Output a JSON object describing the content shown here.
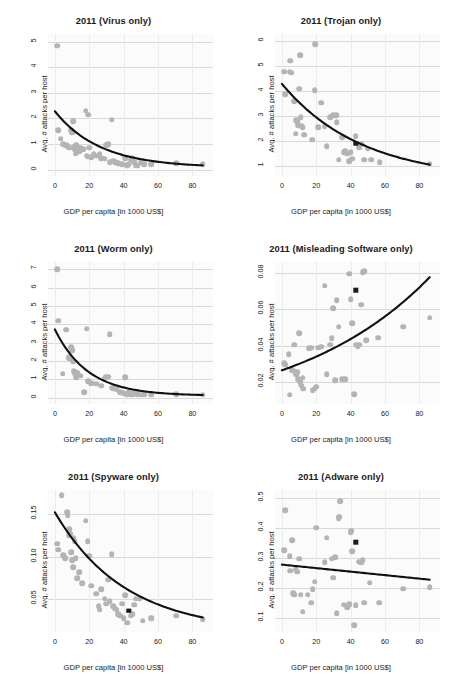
{
  "figure": {
    "xlabel": "GDP per capita [in 1000 US$]",
    "ylabel": "Avg. # attacks per host",
    "colors": {
      "point": "#b4b4b4",
      "fit": "#111111",
      "marker": "#1b1b1b",
      "grid": "#d8d8d8",
      "panel_bg": "#fbfbfb"
    }
  },
  "chart_data": [
    {
      "type": "scatter",
      "title": "2011 (Virus only)",
      "xlabel": "GDP per capita [in 1000 US$]",
      "ylabel": "Avg. # attacks per host",
      "xlim": [
        -4,
        92
      ],
      "ylim": [
        -0.25,
        5.3
      ],
      "xticks": [
        0,
        20,
        40,
        60,
        80
      ],
      "yticks": [
        0,
        1,
        2,
        3,
        4,
        5
      ],
      "grid": true,
      "legend": "none",
      "points": [
        [
          1.5,
          4.85
        ],
        [
          2.0,
          1.55
        ],
        [
          3.5,
          1.2
        ],
        [
          5.0,
          1.0
        ],
        [
          6.5,
          0.95
        ],
        [
          7.5,
          0.92
        ],
        [
          8.5,
          0.85
        ],
        [
          9.5,
          1.55
        ],
        [
          10.0,
          1.45
        ],
        [
          10.5,
          1.9
        ],
        [
          11.0,
          0.88
        ],
        [
          11.5,
          0.8
        ],
        [
          12.0,
          0.62
        ],
        [
          12.5,
          0.95
        ],
        [
          13.0,
          0.9
        ],
        [
          14.0,
          0.72
        ],
        [
          15.0,
          0.85
        ],
        [
          16.5,
          0.8
        ],
        [
          18.0,
          2.3
        ],
        [
          18.5,
          0.55
        ],
        [
          19.0,
          0.5
        ],
        [
          19.5,
          2.15
        ],
        [
          20.0,
          0.85
        ],
        [
          21.0,
          0.48
        ],
        [
          22.5,
          0.6
        ],
        [
          24.0,
          0.55
        ],
        [
          26.0,
          0.62
        ],
        [
          27.0,
          0.45
        ],
        [
          29.0,
          0.42
        ],
        [
          30.0,
          0.95
        ],
        [
          31.0,
          1.0
        ],
        [
          32.0,
          0.3
        ],
        [
          33.0,
          1.95
        ],
        [
          34.0,
          0.35
        ],
        [
          35.0,
          0.3
        ],
        [
          37.0,
          0.25
        ],
        [
          39.0,
          0.2
        ],
        [
          41.0,
          0.45
        ],
        [
          42.0,
          0.18
        ],
        [
          43.0,
          0.22
        ],
        [
          44.0,
          0.4
        ],
        [
          45.0,
          0.45
        ],
        [
          46.0,
          0.28
        ],
        [
          47.0,
          0.18
        ],
        [
          48.0,
          0.15
        ],
        [
          50.0,
          0.3
        ],
        [
          52.0,
          0.2
        ],
        [
          56.0,
          0.2
        ],
        [
          70.5,
          0.25
        ],
        [
          86.0,
          0.22
        ]
      ],
      "fit": {
        "kind": "decay",
        "y0": 2.28,
        "yinf": 0.08,
        "rate": 0.038
      },
      "highlight": null
    },
    {
      "type": "scatter",
      "title": "2011 (Trojan only)",
      "xlabel": "GDP per capita [in 1000 US$]",
      "ylabel": "Avg. # attacks per host",
      "xlim": [
        -4,
        92
      ],
      "ylim": [
        0.6,
        6.3
      ],
      "xticks": [
        0,
        20,
        40,
        60,
        80
      ],
      "yticks": [
        1,
        2,
        3,
        4,
        5,
        6
      ],
      "grid": true,
      "legend": "none",
      "points": [
        [
          1.5,
          4.78
        ],
        [
          2.0,
          3.88
        ],
        [
          4.5,
          4.78
        ],
        [
          5.0,
          5.22
        ],
        [
          5.5,
          4.75
        ],
        [
          7.0,
          3.6
        ],
        [
          8.0,
          2.3
        ],
        [
          8.5,
          2.85
        ],
        [
          9.0,
          2.8
        ],
        [
          9.5,
          2.65
        ],
        [
          10.0,
          4.1
        ],
        [
          10.5,
          5.45
        ],
        [
          11.0,
          2.95
        ],
        [
          11.5,
          2.6
        ],
        [
          12.0,
          2.55
        ],
        [
          13.0,
          2.25
        ],
        [
          17.5,
          2.05
        ],
        [
          19.0,
          4.05
        ],
        [
          19.5,
          5.88
        ],
        [
          21.0,
          2.55
        ],
        [
          23.0,
          3.55
        ],
        [
          25.0,
          2.6
        ],
        [
          26.0,
          1.8
        ],
        [
          28.0,
          2.95
        ],
        [
          30.0,
          3.05
        ],
        [
          31.5,
          3.05
        ],
        [
          32.0,
          2.75
        ],
        [
          33.0,
          1.25
        ],
        [
          35.0,
          2.15
        ],
        [
          36.0,
          1.55
        ],
        [
          37.0,
          1.6
        ],
        [
          38.0,
          1.5
        ],
        [
          39.0,
          1.2
        ],
        [
          40.0,
          1.55
        ],
        [
          41.0,
          1.3
        ],
        [
          43.0,
          2.2
        ],
        [
          45.0,
          1.75
        ],
        [
          46.0,
          1.9
        ],
        [
          48.0,
          1.25
        ],
        [
          50.0,
          1.7
        ],
        [
          52.0,
          1.25
        ],
        [
          57.0,
          1.15
        ],
        [
          86.0,
          1.1
        ]
      ],
      "fit": {
        "kind": "decay",
        "y0": 4.3,
        "yinf": 0.45,
        "rate": 0.0215
      },
      "highlight": [
        43.0,
        1.9
      ]
    },
    {
      "type": "scatter",
      "title": "2011 (Worm only)",
      "xlabel": "GDP per capita [in 1000 US$]",
      "ylabel": "Avg. # attacks per host",
      "xlim": [
        -4,
        92
      ],
      "ylim": [
        -0.35,
        7.4
      ],
      "xticks": [
        0,
        20,
        40,
        60,
        80
      ],
      "yticks": [
        0,
        1,
        2,
        3,
        4,
        5,
        6,
        7
      ],
      "grid": true,
      "legend": "none",
      "points": [
        [
          1.5,
          7.0
        ],
        [
          2.0,
          4.2
        ],
        [
          4.5,
          1.3
        ],
        [
          6.5,
          3.7
        ],
        [
          8.0,
          2.2
        ],
        [
          8.5,
          2.15
        ],
        [
          9.5,
          2.75
        ],
        [
          10.0,
          2.6
        ],
        [
          10.5,
          2.0
        ],
        [
          11.0,
          1.45
        ],
        [
          11.5,
          1.3
        ],
        [
          12.0,
          1.4
        ],
        [
          12.5,
          1.1
        ],
        [
          13.0,
          1.35
        ],
        [
          15.0,
          1.2
        ],
        [
          17.0,
          0.3
        ],
        [
          18.5,
          3.75
        ],
        [
          19.5,
          0.9
        ],
        [
          21.0,
          0.8
        ],
        [
          24.0,
          0.75
        ],
        [
          27.0,
          0.65
        ],
        [
          29.0,
          1.05
        ],
        [
          30.0,
          1.15
        ],
        [
          31.0,
          1.15
        ],
        [
          32.0,
          3.45
        ],
        [
          33.0,
          0.55
        ],
        [
          34.0,
          0.5
        ],
        [
          36.0,
          0.45
        ],
        [
          38.0,
          0.3
        ],
        [
          40.0,
          0.25
        ],
        [
          41.0,
          1.1
        ],
        [
          42.0,
          0.2
        ],
        [
          43.0,
          0.3
        ],
        [
          44.0,
          0.15
        ],
        [
          45.0,
          0.2
        ],
        [
          46.0,
          0.25
        ],
        [
          48.0,
          0.2
        ],
        [
          50.0,
          0.15
        ],
        [
          52.0,
          0.2
        ],
        [
          56.0,
          0.15
        ],
        [
          70.5,
          0.2
        ],
        [
          86.0,
          0.15
        ]
      ],
      "fit": {
        "kind": "decay",
        "y0": 3.72,
        "yinf": 0.1,
        "rate": 0.052
      },
      "highlight": null
    },
    {
      "type": "scatter",
      "title": "2011 (Misleading Software only)",
      "xlabel": "GDP per capita [in 1000 US$]",
      "ylabel": "Avg. # attacks per host",
      "xlim": [
        -4,
        92
      ],
      "ylim": [
        0.008,
        0.086
      ],
      "xticks": [
        0,
        20,
        40,
        60,
        80
      ],
      "yticks": [
        0.02,
        0.04,
        0.06,
        0.08
      ],
      "ytick_labels": [
        "0.02",
        "0.04",
        "0.06",
        "0.08"
      ],
      "grid": true,
      "legend": "none",
      "points": [
        [
          1.5,
          0.0305
        ],
        [
          2.0,
          0.0295
        ],
        [
          4.0,
          0.0355
        ],
        [
          4.5,
          0.013
        ],
        [
          6.0,
          0.0265
        ],
        [
          7.0,
          0.0405
        ],
        [
          8.0,
          0.0255
        ],
        [
          8.5,
          0.0245
        ],
        [
          9.0,
          0.0255
        ],
        [
          9.5,
          0.0215
        ],
        [
          10.0,
          0.047
        ],
        [
          10.5,
          0.0205
        ],
        [
          11.0,
          0.0185
        ],
        [
          11.5,
          0.018
        ],
        [
          12.0,
          0.0225
        ],
        [
          12.5,
          0.0165
        ],
        [
          16.0,
          0.0385
        ],
        [
          17.0,
          0.039
        ],
        [
          18.0,
          0.0155
        ],
        [
          19.0,
          0.0165
        ],
        [
          20.0,
          0.0175
        ],
        [
          21.0,
          0.039
        ],
        [
          23.0,
          0.0395
        ],
        [
          25.0,
          0.073
        ],
        [
          26.0,
          0.0245
        ],
        [
          28.0,
          0.0405
        ],
        [
          29.0,
          0.044
        ],
        [
          30.0,
          0.0605
        ],
        [
          31.0,
          0.021
        ],
        [
          32.0,
          0.065
        ],
        [
          33.0,
          0.0505
        ],
        [
          35.0,
          0.0215
        ],
        [
          37.0,
          0.0215
        ],
        [
          39.0,
          0.0795
        ],
        [
          40.0,
          0.0655
        ],
        [
          41.0,
          0.0525
        ],
        [
          42.0,
          0.0135
        ],
        [
          43.0,
          0.0405
        ],
        [
          44.0,
          0.0395
        ],
        [
          45.0,
          0.0405
        ],
        [
          46.0,
          0.0625
        ],
        [
          47.0,
          0.0805
        ],
        [
          48.0,
          0.081
        ],
        [
          49.0,
          0.043
        ],
        [
          56.0,
          0.0445
        ],
        [
          70.5,
          0.0505
        ],
        [
          86.0,
          0.0555
        ]
      ],
      "fit": {
        "kind": "growth",
        "y0": 0.0265,
        "rate": 0.0125
      },
      "highlight": [
        43.0,
        0.0705
      ]
    },
    {
      "type": "scatter",
      "title": "2011 (Spyware only)",
      "xlabel": "GDP per capita [in 1000 US$]",
      "ylabel": "Avg. # attacks per host",
      "xlim": [
        -4,
        92
      ],
      "ylim": [
        0.012,
        0.178
      ],
      "xticks": [
        0,
        20,
        40,
        60,
        80
      ],
      "yticks": [
        0.05,
        0.1,
        0.15
      ],
      "ytick_labels": [
        "0.05",
        "0.10",
        "0.15"
      ],
      "grid": true,
      "legend": "none",
      "points": [
        [
          1.5,
          0.115
        ],
        [
          2.0,
          0.108
        ],
        [
          4.0,
          0.172
        ],
        [
          5.0,
          0.102
        ],
        [
          6.0,
          0.098
        ],
        [
          7.0,
          0.152
        ],
        [
          7.5,
          0.148
        ],
        [
          8.0,
          0.125
        ],
        [
          8.5,
          0.132
        ],
        [
          9.0,
          0.127
        ],
        [
          9.5,
          0.105
        ],
        [
          10.0,
          0.096
        ],
        [
          10.5,
          0.088
        ],
        [
          11.0,
          0.122
        ],
        [
          11.5,
          0.118
        ],
        [
          12.0,
          0.098
        ],
        [
          13.0,
          0.075
        ],
        [
          14.0,
          0.082
        ],
        [
          16.0,
          0.069
        ],
        [
          18.0,
          0.142
        ],
        [
          19.0,
          0.118
        ],
        [
          20.0,
          0.101
        ],
        [
          21.0,
          0.066
        ],
        [
          24.0,
          0.057
        ],
        [
          25.5,
          0.042
        ],
        [
          26.0,
          0.038
        ],
        [
          27.0,
          0.062
        ],
        [
          29.0,
          0.051
        ],
        [
          30.0,
          0.045
        ],
        [
          31.0,
          0.073
        ],
        [
          32.0,
          0.048
        ],
        [
          33.0,
          0.103
        ],
        [
          34.0,
          0.042
        ],
        [
          35.0,
          0.039
        ],
        [
          36.0,
          0.038
        ],
        [
          37.0,
          0.033
        ],
        [
          38.0,
          0.031
        ],
        [
          39.0,
          0.045
        ],
        [
          40.0,
          0.028
        ],
        [
          41.0,
          0.055
        ],
        [
          42.0,
          0.023
        ],
        [
          43.0,
          0.037
        ],
        [
          44.0,
          0.031
        ],
        [
          45.0,
          0.033
        ],
        [
          46.0,
          0.044
        ],
        [
          47.0,
          0.051
        ],
        [
          49.0,
          0.051
        ],
        [
          51.0,
          0.025
        ],
        [
          56.0,
          0.028
        ],
        [
          70.5,
          0.031
        ],
        [
          86.0,
          0.027
        ]
      ],
      "fit": {
        "kind": "decay",
        "y0": 0.152,
        "yinf": 0.012,
        "rate": 0.0245
      },
      "highlight": [
        43.0,
        0.037
      ]
    },
    {
      "type": "scatter",
      "title": "2011 (Adware only)",
      "xlabel": "GDP per capita [in 1000 US$]",
      "ylabel": "Avg. # attacks per host",
      "xlim": [
        -4,
        92
      ],
      "ylim": [
        0.055,
        0.525
      ],
      "xticks": [
        0,
        20,
        40,
        60,
        80
      ],
      "yticks": [
        0.1,
        0.2,
        0.3,
        0.4,
        0.5
      ],
      "ytick_labels": [
        "0.1",
        "0.2",
        "0.3",
        "0.4",
        "0.5"
      ],
      "grid": true,
      "legend": "none",
      "points": [
        [
          1.5,
          0.325
        ],
        [
          2.0,
          0.458
        ],
        [
          4.5,
          0.305
        ],
        [
          5.0,
          0.258
        ],
        [
          6.0,
          0.358
        ],
        [
          6.5,
          0.183
        ],
        [
          7.0,
          0.178
        ],
        [
          8.0,
          0.262
        ],
        [
          9.0,
          0.255
        ],
        [
          10.0,
          0.297
        ],
        [
          11.0,
          0.178
        ],
        [
          12.0,
          0.122
        ],
        [
          15.0,
          0.178
        ],
        [
          17.0,
          0.152
        ],
        [
          18.0,
          0.197
        ],
        [
          19.0,
          0.222
        ],
        [
          20.0,
          0.4
        ],
        [
          25.0,
          0.287
        ],
        [
          26.0,
          0.367
        ],
        [
          29.0,
          0.297
        ],
        [
          30.0,
          0.235
        ],
        [
          31.0,
          0.302
        ],
        [
          32.0,
          0.118
        ],
        [
          33.0,
          0.432
        ],
        [
          33.5,
          0.437
        ],
        [
          34.0,
          0.487
        ],
        [
          36.0,
          0.145
        ],
        [
          38.0,
          0.138
        ],
        [
          39.0,
          0.147
        ],
        [
          40.0,
          0.385
        ],
        [
          40.5,
          0.39
        ],
        [
          41.0,
          0.322
        ],
        [
          42.0,
          0.078
        ],
        [
          43.0,
          0.143
        ],
        [
          45.0,
          0.288
        ],
        [
          46.0,
          0.285
        ],
        [
          47.0,
          0.292
        ],
        [
          48.0,
          0.152
        ],
        [
          51.0,
          0.218
        ],
        [
          56.5,
          0.152
        ],
        [
          70.5,
          0.198
        ],
        [
          86.0,
          0.203
        ]
      ],
      "fit": {
        "kind": "linear",
        "y0": 0.278,
        "slope": -0.00058
      },
      "highlight": [
        43.0,
        0.352
      ]
    }
  ]
}
